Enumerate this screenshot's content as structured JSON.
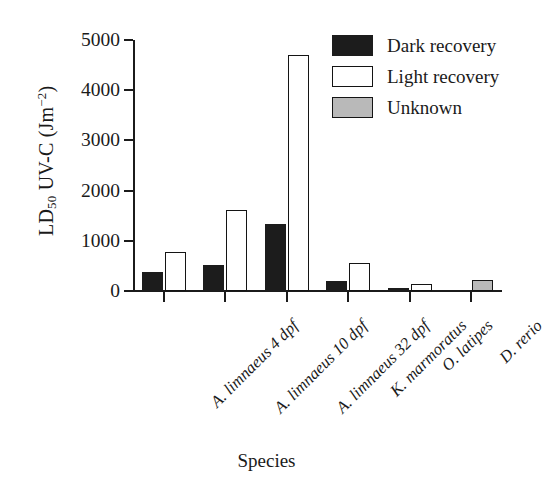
{
  "chart_data": {
    "type": "bar",
    "title": "",
    "xlabel": "Species",
    "ylabel_html": "LD50 UV-C (Jm-2)",
    "ylabel_parts": {
      "main1": "LD",
      "sub": "50",
      "main2": " UV-C (Jm",
      "sup": "−2",
      "main3": ")"
    },
    "categories": [
      "A. limnaeus 4 dpf",
      "A. limnaeus 10 dpf",
      "A. limnaeus 32 dpf",
      "K. marmoratus",
      "O. latipes",
      "D. rerio"
    ],
    "series": [
      {
        "name": "Dark recovery",
        "color": "#1c1c1c",
        "values": [
          380,
          510,
          1330,
          200,
          60,
          null
        ]
      },
      {
        "name": "Light recovery",
        "color": "#ffffff",
        "values": [
          780,
          1610,
          4700,
          560,
          130,
          null
        ]
      },
      {
        "name": "Unknown",
        "color": "#b9b9b9",
        "values": [
          null,
          null,
          null,
          null,
          null,
          220
        ]
      }
    ],
    "ylim": [
      0,
      5000
    ],
    "yticks": [
      0,
      1000,
      2000,
      3000,
      4000,
      5000
    ],
    "ytick_labels": [
      "0",
      "1000",
      "2000",
      "3000",
      "4000",
      "5000"
    ],
    "grid": false,
    "legend_position": "top-right"
  },
  "legend": {
    "items": [
      {
        "label": "Dark recovery",
        "swatch": "dark"
      },
      {
        "label": "Light recovery",
        "swatch": "light"
      },
      {
        "label": "Unknown",
        "swatch": "unknown"
      }
    ]
  },
  "axes": {
    "x_title": "Species"
  }
}
